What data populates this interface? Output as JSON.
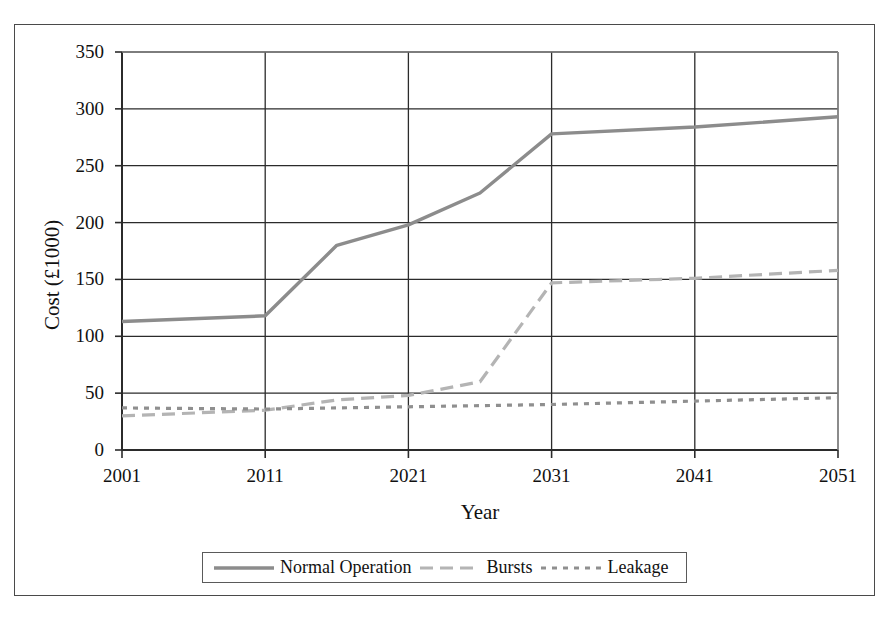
{
  "chart_data": {
    "type": "line",
    "title": "",
    "xlabel": "Year",
    "ylabel": "Cost (£1000)",
    "xlim": [
      2001,
      2051
    ],
    "ylim": [
      0,
      350
    ],
    "xticks": [
      "2001",
      "2011",
      "2021",
      "2031",
      "2041",
      "2051"
    ],
    "yticks": [
      "0",
      "50",
      "100",
      "150",
      "200",
      "250",
      "300",
      "350"
    ],
    "grid": true,
    "legend_position": "bottom-center",
    "x": [
      2001,
      2011,
      2016,
      2021,
      2026,
      2031,
      2041,
      2051
    ],
    "series": [
      {
        "name": "Normal Operation",
        "style": "solid",
        "color": "#8c8c8c",
        "values": [
          113,
          118,
          180,
          198,
          226,
          278,
          284,
          293
        ]
      },
      {
        "name": "Bursts",
        "style": "long-dash",
        "color": "#b4b4b4",
        "values": [
          30,
          35,
          44,
          48,
          60,
          147,
          151,
          158
        ]
      },
      {
        "name": "Leakage",
        "style": "short-dash",
        "color": "#8f8f8f",
        "values": [
          37,
          36,
          37,
          38,
          39,
          40,
          43,
          46
        ]
      }
    ]
  },
  "axes": {
    "ylabel": "Cost (£1000)",
    "xlabel": "Year",
    "yticks": [
      {
        "label": "350",
        "value": 350
      },
      {
        "label": "300",
        "value": 300
      },
      {
        "label": "250",
        "value": 250
      },
      {
        "label": "200",
        "value": 200
      },
      {
        "label": "150",
        "value": 150
      },
      {
        "label": "100",
        "value": 100
      },
      {
        "label": "50",
        "value": 50
      },
      {
        "label": "0",
        "value": 0
      }
    ],
    "xticks": [
      {
        "label": "2001",
        "value": 2001
      },
      {
        "label": "2011",
        "value": 2011
      },
      {
        "label": "2021",
        "value": 2021
      },
      {
        "label": "2031",
        "value": 2031
      },
      {
        "label": "2041",
        "value": 2041
      },
      {
        "label": "2051",
        "value": 2051
      }
    ]
  },
  "legend": {
    "entries": [
      {
        "label": "Normal Operation",
        "style": "solid",
        "color": "#8c8c8c"
      },
      {
        "label": "Bursts",
        "style": "long-dash",
        "color": "#b4b4b4"
      },
      {
        "label": "Leakage",
        "style": "short-dash",
        "color": "#8f8f8f"
      }
    ]
  },
  "colors": {
    "axis": "#2b2b2b",
    "grid": "#2b2b2b",
    "frame": "#4a4a4a",
    "background": "#ffffff",
    "normal_operation": "#8c8c8c",
    "bursts": "#b4b4b4",
    "leakage": "#8f8f8f"
  }
}
